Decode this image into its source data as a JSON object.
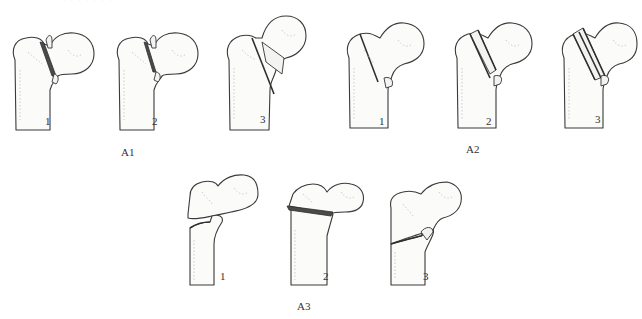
{
  "header": {
    "cut_text": "· · · · · · ·"
  },
  "groups": [
    {
      "label": "A1",
      "figures": [
        {
          "num": "1"
        },
        {
          "num": "2"
        },
        {
          "num": "3"
        }
      ]
    },
    {
      "label": "A2",
      "figures": [
        {
          "num": "1"
        },
        {
          "num": "2"
        },
        {
          "num": "3"
        }
      ]
    },
    {
      "label": "A3",
      "figures": [
        {
          "num": "1"
        },
        {
          "num": "2"
        },
        {
          "num": "3"
        }
      ]
    }
  ],
  "colors": {
    "outline": "#3a3a3a",
    "fracture": "#4a4a4a",
    "bone": "#fbfbfa",
    "background": "#ffffff"
  }
}
